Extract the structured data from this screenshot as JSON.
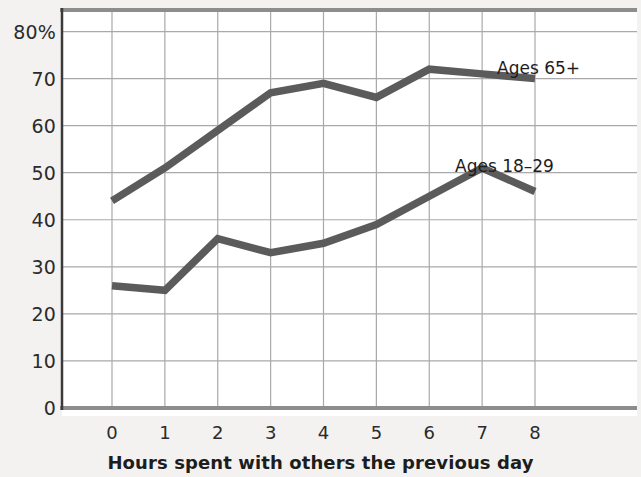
{
  "chart_data": {
    "type": "line",
    "title": "",
    "subtitle": "",
    "xlabel": "Hours spent with others the previous day",
    "ylabel": "",
    "x": [
      0,
      1,
      2,
      3,
      4,
      5,
      6,
      7,
      8
    ],
    "categories": [
      "0",
      "1",
      "2",
      "3",
      "4",
      "5",
      "6",
      "7",
      "8"
    ],
    "xlim": [
      0,
      8
    ],
    "ylim": [
      0,
      85
    ],
    "y_ticks": [
      0,
      10,
      20,
      30,
      40,
      50,
      60,
      70,
      80
    ],
    "y_tick_labels": [
      "0",
      "10",
      "20",
      "30",
      "40",
      "50",
      "60",
      "70",
      "80%"
    ],
    "grid": true,
    "legend_position": "inline-annotations",
    "series": [
      {
        "name": "Ages 65+",
        "color": "#5b5b5b",
        "label_text": "Ages 65+",
        "values": [
          44,
          51,
          59,
          67,
          69,
          66,
          72,
          71,
          70
        ]
      },
      {
        "name": "Ages 18-29",
        "color": "#5b5b5b",
        "label_text": "Ages 18–29",
        "values": [
          26,
          25,
          36,
          33,
          35,
          39,
          45,
          51,
          46
        ]
      }
    ]
  },
  "axes": {
    "x_title": "Hours spent with others the previous day",
    "x_tick_labels": [
      "0",
      "1",
      "2",
      "3",
      "4",
      "5",
      "6",
      "7",
      "8"
    ],
    "y_tick_labels": [
      "80%",
      "70",
      "60",
      "50",
      "40",
      "30",
      "20",
      "10",
      "0"
    ]
  },
  "annotations": {
    "older_label": "Ages 65+",
    "younger_label": "Ages 18–29"
  },
  "colors": {
    "line": "#5b5b5b",
    "grid": "#a9a9a9",
    "axis": "#3b3b3b",
    "background": "#f3f2f0",
    "plot_background": "#ffffff"
  }
}
